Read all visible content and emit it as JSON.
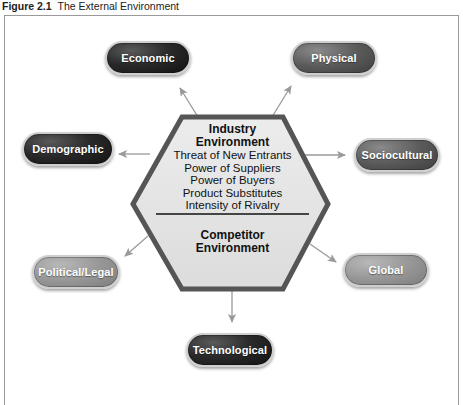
{
  "figure": {
    "number": "Figure 2.1",
    "title": "The External Environment"
  },
  "center": {
    "industry_title_line1": "Industry",
    "industry_title_line2": "Environment",
    "industry_items": [
      "Threat of New Entrants",
      "Power of Suppliers",
      "Power of Buyers",
      "Product Substitutes",
      "Intensity of Rivalry"
    ],
    "competitor_title_line1": "Competitor",
    "competitor_title_line2": "Environment"
  },
  "segments": [
    {
      "id": "economic",
      "label": "Economic",
      "shade": "dark"
    },
    {
      "id": "physical",
      "label": "Physical",
      "shade": "mid"
    },
    {
      "id": "demographic",
      "label": "Demographic",
      "shade": "dark"
    },
    {
      "id": "sociocultural",
      "label": "Sociocultural",
      "shade": "mid"
    },
    {
      "id": "political-legal",
      "label": "Political/Legal",
      "shade": "light"
    },
    {
      "id": "global",
      "label": "Global",
      "shade": "light"
    },
    {
      "id": "technological",
      "label": "Technological",
      "shade": "dark"
    }
  ],
  "colors": {
    "hex_fill": "#e4e4e4",
    "hex_border": "#555555",
    "arrow": "#9a9a9a",
    "frame": "#9a9a9a"
  }
}
